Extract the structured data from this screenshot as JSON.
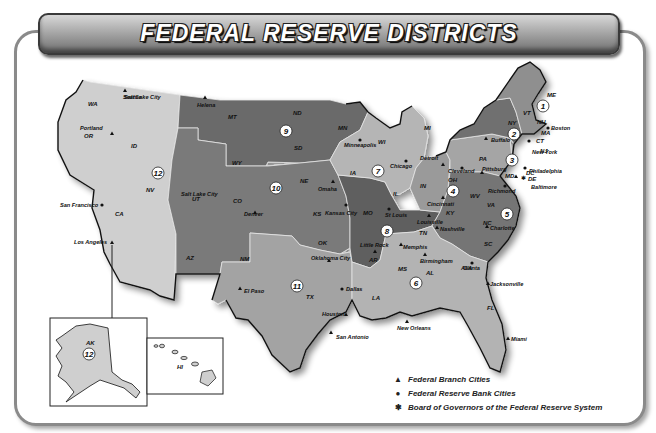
{
  "title": "FEDERAL RESERVE DISTRICTS",
  "colors": {
    "light": "#cfcfcf",
    "medium": "#a9a9a9",
    "medium_dark": "#8a8a8a",
    "dark": "#6b6b6b",
    "border": "#111111",
    "state_line": "#e6e6e6"
  },
  "districts": [
    {
      "number": "1",
      "states": [
        "ME",
        "VT",
        "NH",
        "MA",
        "CT",
        "RI"
      ]
    },
    {
      "number": "2",
      "states": [
        "NY"
      ]
    },
    {
      "number": "3",
      "states": [
        "PA",
        "DE"
      ]
    },
    {
      "number": "4",
      "states": [
        "OH"
      ]
    },
    {
      "number": "5",
      "states": [
        "WV",
        "VA",
        "MD",
        "NC",
        "SC",
        "DC"
      ]
    },
    {
      "number": "6",
      "states": [
        "TN",
        "MS",
        "AL",
        "GA",
        "FL",
        "LA"
      ]
    },
    {
      "number": "7",
      "states": [
        "IA",
        "WI",
        "IL",
        "IN",
        "MI"
      ]
    },
    {
      "number": "8",
      "states": [
        "MO",
        "AR",
        "KY"
      ]
    },
    {
      "number": "9",
      "states": [
        "MT",
        "ND",
        "SD",
        "MN"
      ]
    },
    {
      "number": "10",
      "states": [
        "WY",
        "NE",
        "CO",
        "KS",
        "OK",
        "NM"
      ]
    },
    {
      "number": "11",
      "states": [
        "TX"
      ]
    },
    {
      "number": "12",
      "states": [
        "WA",
        "OR",
        "ID",
        "NV",
        "CA",
        "UT",
        "AZ",
        "AK",
        "HI"
      ]
    }
  ],
  "state_labels": [
    "WA",
    "OR",
    "ID",
    "MT",
    "WY",
    "NV",
    "CA",
    "UT",
    "AZ",
    "CO",
    "NM",
    "ND",
    "SD",
    "NE",
    "KS",
    "OK",
    "TX",
    "MN",
    "IA",
    "MO",
    "AR",
    "LA",
    "WI",
    "IL",
    "MI",
    "IN",
    "OH",
    "KY",
    "TN",
    "MS",
    "AL",
    "GA",
    "FL",
    "SC",
    "NC",
    "VA",
    "WV",
    "PA",
    "NY",
    "MD",
    "DE",
    "DC",
    "NJ",
    "VT",
    "NH",
    "ME",
    "MA",
    "CT",
    "RI",
    "AK",
    "HI"
  ],
  "cities": {
    "reserve_banks": [
      "Boston",
      "New York",
      "Philadelphia",
      "Cleveland",
      "Richmond",
      "Atlanta",
      "Chicago",
      "St Louis",
      "Minneapolis",
      "Kansas City",
      "Dallas",
      "San Francisco"
    ],
    "branches": [
      "Buffalo",
      "Pittsburg",
      "Cincinnati",
      "Baltimore",
      "Charlotte",
      "Birmingham",
      "Jacksonville",
      "Miami",
      "Nashville",
      "New Orleans",
      "Detroit",
      "Louisville",
      "Little Rock",
      "Memphis",
      "Helena",
      "Denver",
      "Oklahoma City",
      "Omaha",
      "El Paso",
      "Houston",
      "San Antonio",
      "Los Angeles",
      "Portland",
      "Salt Lake City",
      "Seattle"
    ],
    "board": [
      "Washington DC"
    ]
  },
  "legend": {
    "items": [
      {
        "symbol": "▲",
        "label": "Federal Branch Cities"
      },
      {
        "symbol": "●",
        "label": "Federal Reserve Bank Cities"
      },
      {
        "symbol": "✱",
        "label": "Board of Governors of the Federal Reserve System"
      }
    ]
  },
  "insets": {
    "alaska": {
      "label": "AK",
      "district": "12"
    },
    "hawaii": {
      "label": "HI"
    }
  }
}
